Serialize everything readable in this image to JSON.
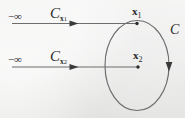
{
  "figure": {
    "kind": "complex-contour-integration-diagram",
    "background_color": "#f1f1f0",
    "stroke_color": "#6d6d6d",
    "text_color": "#2b2b2b",
    "contour_label": "C",
    "branch_cut_label": "C",
    "lines": [
      {
        "id": "upper",
        "start_label": "−∞",
        "path_label_base": "C",
        "path_label_sub_var": "x",
        "path_label_sub_index": "1",
        "endpoint_label_base": "x",
        "endpoint_label_index": "1",
        "direction": "right"
      },
      {
        "id": "lower",
        "start_label": "−∞",
        "path_label_base": "C",
        "path_label_sub_var": "x",
        "path_label_sub_index": "2",
        "endpoint_label_base": "x",
        "endpoint_label_index": "2",
        "direction": "right"
      }
    ],
    "ellipse": {
      "label": "C",
      "orientation_arrow": "down-right",
      "center_x": 137,
      "center_y": 65,
      "radius_x": 32,
      "radius_y": 45
    }
  }
}
